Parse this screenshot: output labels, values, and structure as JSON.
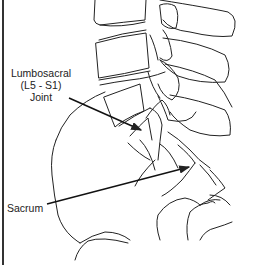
{
  "diagram": {
    "labels": {
      "lumbosacral_line1": "Lumbosacral",
      "lumbosacral_line2": "(L5 - S1)",
      "lumbosacral_line3": "Joint",
      "sacrum": "Sacrum"
    },
    "colors": {
      "line": "#222222",
      "background": "#ffffff",
      "border": "#333333"
    }
  }
}
